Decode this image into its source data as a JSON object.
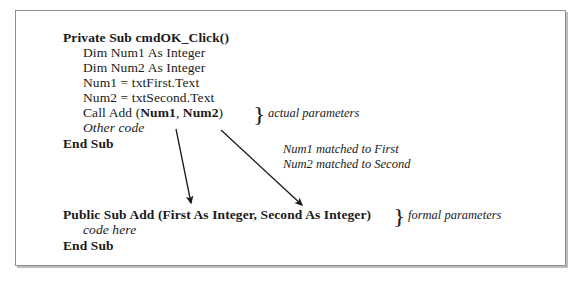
{
  "figure": {
    "title_semantic": "visual-basic-parameter-passing-diagram",
    "border_color": "#8d8d8d",
    "text_color": "#1a1a1a",
    "background": "#ffffff"
  },
  "calling_procedure": {
    "lines": [
      {
        "text": "Private Sub cmdOK_Click()",
        "style": "bold",
        "indent": 0
      },
      {
        "text": "Dim Num1 As Integer",
        "style": "normal",
        "indent": 1
      },
      {
        "text": "Dim Num2 As Integer",
        "style": "normal",
        "indent": 1
      },
      {
        "text": "Num1 = txtFirst.Text",
        "style": "normal",
        "indent": 1
      },
      {
        "text": "Num2 = txtSecond.Text",
        "style": "normal",
        "indent": 1
      },
      {
        "text": "Other code",
        "style": "italic",
        "indent": 1
      },
      {
        "text": "End Sub",
        "style": "bold",
        "indent": 0
      }
    ],
    "call_line": {
      "prefix": "Call Add (",
      "arg1": "Num1",
      "separator": ", ",
      "arg2": "Num2",
      "suffix": ")"
    }
  },
  "called_procedure": {
    "header": "Public Sub Add (First As Integer, Second As Integer)",
    "body": "code here",
    "footer": "End Sub"
  },
  "annotations": {
    "actual_parameters": "actual parameters",
    "formal_parameters": "formal parameters",
    "match_line_1": "Num1 matched to First",
    "match_line_2": "Num2 matched to Second",
    "brace_glyph": "}"
  }
}
